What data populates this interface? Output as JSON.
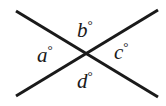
{
  "figure": {
    "kind": "geometry-diagram",
    "background_color": "#ffffff",
    "stroke_color": "#1a1a1a",
    "stroke_width": 3,
    "width": 166,
    "height": 106,
    "intersection": {
      "x": 87,
      "y": 54
    }
  },
  "lines": [
    {
      "name": "line-descending",
      "from": {
        "x": 16,
        "y": 11
      },
      "to": {
        "x": 158,
        "y": 97
      }
    },
    {
      "name": "line-ascending",
      "from": {
        "x": 16,
        "y": 96
      },
      "to": {
        "x": 158,
        "y": 10
      }
    }
  ],
  "labels": {
    "a": {
      "text": "a",
      "degree": "°",
      "position": "left"
    },
    "b": {
      "text": "b",
      "degree": "°",
      "position": "top"
    },
    "c": {
      "text": "c",
      "degree": "°",
      "position": "right"
    },
    "d": {
      "text": "d",
      "degree": "°",
      "position": "bottom"
    }
  }
}
